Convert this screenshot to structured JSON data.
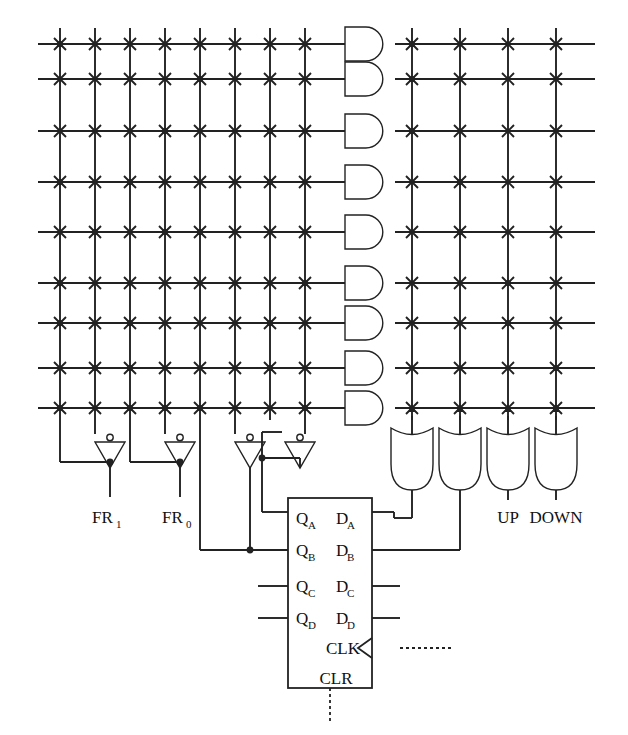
{
  "diagram": {
    "type": "logic-circuit-schematic",
    "line_color": "#222222",
    "background": "#ffffff"
  },
  "pla": {
    "description": "Programmable logic array: AND-plane on the left, OR-plane on the right",
    "and_gate_count": 9,
    "or_gate_count": 4,
    "left_columns": 8,
    "right_columns": 4,
    "rows": 9,
    "row_y": [
      44,
      79,
      131,
      182,
      232,
      283,
      323,
      368,
      408
    ],
    "left_col_x": [
      60,
      95,
      130,
      165,
      200,
      235,
      270,
      305
    ],
    "right_col_x": [
      412,
      460,
      508,
      556
    ],
    "connected_left": [
      [
        1,
        0,
        0,
        0,
        0,
        0,
        0,
        0
      ],
      [
        0,
        0,
        0,
        0,
        1,
        0,
        0,
        0
      ],
      [
        0,
        0,
        0,
        1,
        0,
        0,
        1,
        0
      ],
      [
        1,
        0,
        1,
        0,
        0,
        0,
        1,
        0
      ],
      [
        0,
        1,
        0,
        1,
        1,
        0,
        0,
        0
      ],
      [
        1,
        0,
        0,
        0,
        0,
        0,
        0,
        1
      ],
      [
        1,
        0,
        1,
        0,
        0,
        0,
        1,
        0
      ],
      [
        0,
        1,
        1,
        0,
        0,
        0,
        1,
        0
      ],
      [
        1,
        0,
        1,
        1,
        1,
        0,
        0,
        1
      ]
    ],
    "connected_right": [
      [
        1,
        0,
        0,
        0
      ],
      [
        1,
        0,
        0,
        0
      ],
      [
        1,
        0,
        0,
        0
      ],
      [
        0,
        1,
        0,
        0
      ],
      [
        0,
        1,
        0,
        0
      ],
      [
        0,
        0,
        1,
        0
      ],
      [
        0,
        0,
        1,
        0
      ],
      [
        0,
        0,
        0,
        1
      ],
      [
        0,
        0,
        0,
        1
      ]
    ]
  },
  "inverters": {
    "count": 4,
    "x": [
      110,
      180,
      250,
      300
    ],
    "y": 440
  },
  "outputs": {
    "fr1": "FR",
    "fr1_sub": "1",
    "fr0": "FR",
    "fr0_sub": "0",
    "up": "UP",
    "down": "DOWN"
  },
  "register": {
    "name": "4-bit D register",
    "left_pins": [
      {
        "base": "Q",
        "sub": "A"
      },
      {
        "base": "Q",
        "sub": "B"
      },
      {
        "base": "Q",
        "sub": "C"
      },
      {
        "base": "Q",
        "sub": "D"
      }
    ],
    "right_pins": [
      {
        "base": "D",
        "sub": "A"
      },
      {
        "base": "D",
        "sub": "B"
      },
      {
        "base": "D",
        "sub": "C"
      },
      {
        "base": "D",
        "sub": "D"
      }
    ],
    "clock_label": "CLK",
    "clear_label": "CLR"
  }
}
